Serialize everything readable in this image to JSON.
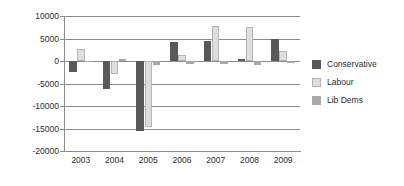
{
  "chart_data": {
    "type": "bar",
    "title": "",
    "xlabel": "",
    "ylabel": "",
    "categories": [
      "2003",
      "2004",
      "2005",
      "2006",
      "2007",
      "2008",
      "2009"
    ],
    "series": [
      {
        "name": "Conservative",
        "color": "#595959",
        "values": [
          -2400,
          -6200,
          -15600,
          4200,
          4500,
          500,
          5000
        ]
      },
      {
        "name": "Labour",
        "color": "#dedede",
        "values": [
          2600,
          -2800,
          -14700,
          1300,
          7800,
          7500,
          2200
        ]
      },
      {
        "name": "Lib Dems",
        "color": "#a8a8a8",
        "values": [
          -200,
          500,
          -800,
          -700,
          -600,
          -800,
          -400
        ]
      }
    ],
    "ylim": [
      -20000,
      10000
    ],
    "ytick_values": [
      10000,
      5000,
      0,
      -5000,
      -10000,
      -15000,
      -20000
    ],
    "ytick_labels": [
      "10000",
      "5000",
      "0",
      "-5000",
      "-10000",
      "-15000",
      "-20000"
    ],
    "grid": true,
    "legend_position": "right"
  },
  "legend": {
    "entries": [
      {
        "label": "Conservative",
        "swatch": "conservative"
      },
      {
        "label": "Labour",
        "swatch": "labour"
      },
      {
        "label": "Lib Dems",
        "swatch": "libdems"
      }
    ]
  }
}
